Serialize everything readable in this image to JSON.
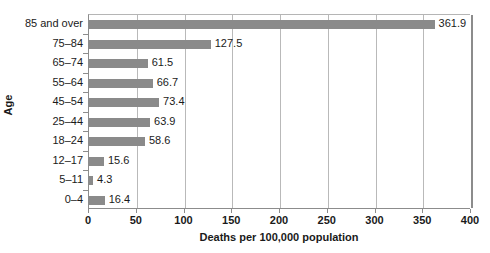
{
  "chart_data": {
    "type": "bar",
    "orientation": "horizontal",
    "title": "",
    "xlabel": "Deaths per 100,000 population",
    "ylabel": "Age",
    "categories": [
      "85 and over",
      "75–84",
      "65–74",
      "55–64",
      "45–54",
      "25–44",
      "18–24",
      "12–17",
      "5–11",
      "0–4"
    ],
    "values": [
      361.9,
      127.5,
      61.5,
      66.7,
      73.4,
      63.9,
      58.6,
      15.6,
      4.3,
      16.4
    ],
    "value_labels": [
      "361.9",
      "127.5",
      "61.5",
      "66.7",
      "73.4",
      "63.9",
      "58.6",
      "15.6",
      "4.3",
      "16.4"
    ],
    "xlim": [
      0,
      400
    ],
    "xticks": [
      0,
      50,
      100,
      150,
      200,
      250,
      300,
      350,
      400
    ],
    "xtick_labels": [
      "0",
      "50",
      "100",
      "150",
      "200",
      "250",
      "300",
      "350",
      "400"
    ],
    "grid": "vertical",
    "legend": "none",
    "bar_color": "#8a8a8a",
    "gridline_color": "#b9b9b9",
    "axis_color": "#8c8c8c",
    "text_color": "#1a1a1a"
  }
}
